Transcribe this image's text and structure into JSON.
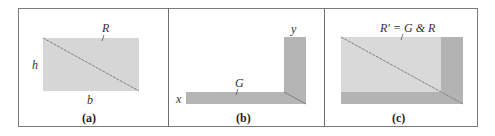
{
  "figure": {
    "panels": [
      {
        "id": "a",
        "caption": "(a)",
        "labels": {
          "region": "R",
          "height": "h",
          "base": "b"
        },
        "description": "Rectangle region R with height h and base b, diagonal drawn"
      },
      {
        "id": "b",
        "caption": "(b)",
        "labels": {
          "region": "G",
          "x_axis": "x",
          "y_axis": "y"
        },
        "description": "L-shaped region G along x and y axes"
      },
      {
        "id": "c",
        "caption": "(c)",
        "labels": {
          "region": "R′ = G & R"
        },
        "description": "Combined region R′ = G & R: rectangle R overlaid with L-shaped G band"
      }
    ],
    "colors": {
      "border": "#7a7a7a",
      "region_light": "#d4d4d4",
      "region_dark": "#b3b3b3",
      "diagonal": "#7d7d88",
      "text": "#333333"
    }
  }
}
